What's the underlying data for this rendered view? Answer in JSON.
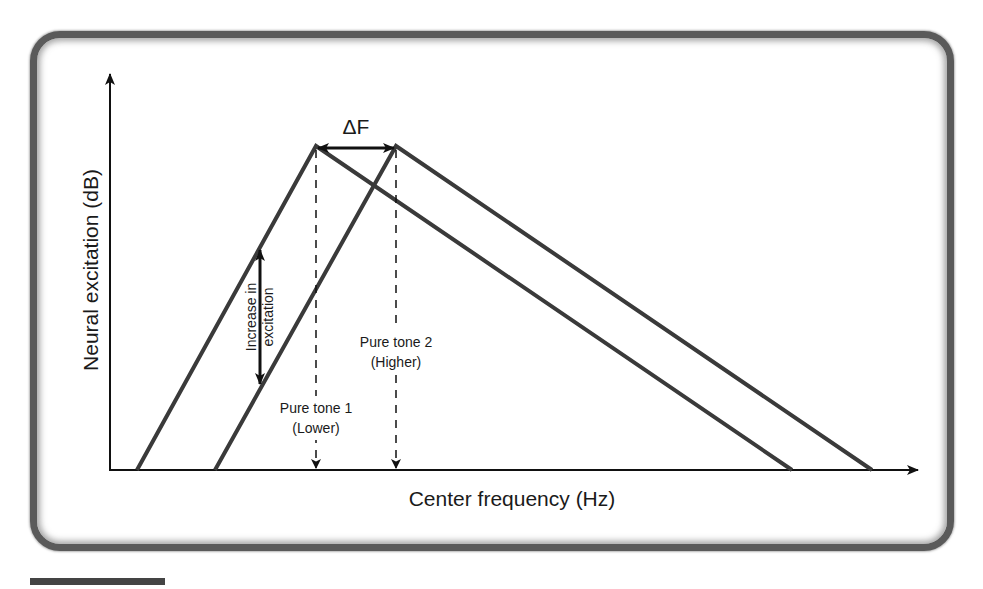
{
  "diagram": {
    "y_axis_label": "Neural excitation (dB)",
    "x_axis_label": "Center frequency (Hz)",
    "delta_label": "ΔF",
    "increase_label_line1": "Increase in",
    "increase_label_line2": "excitation",
    "tone1_line1": "Pure tone 1",
    "tone1_line2": "(Lower)",
    "tone2_line1": "Pure tone 2",
    "tone2_line2": "(Higher)",
    "colors": {
      "curve": "#3a3a3a",
      "axis": "#111111",
      "frame": "#5a5a5a",
      "text": "#1a1a1a"
    },
    "excitation_patterns": [
      {
        "name": "Pure tone 1 (Lower)",
        "points": [
          [
            137,
            470
          ],
          [
            316,
            146
          ],
          [
            792,
            470
          ]
        ]
      },
      {
        "name": "Pure tone 2 (Higher)",
        "points": [
          [
            215,
            470
          ],
          [
            396,
            146
          ],
          [
            872,
            470
          ]
        ]
      }
    ]
  }
}
